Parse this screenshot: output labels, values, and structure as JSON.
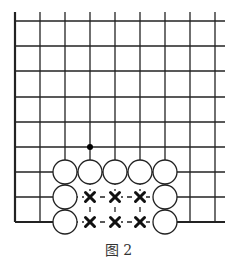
{
  "figure": {
    "caption": "图 2",
    "grid": {
      "x_lines": [
        15,
        40,
        65,
        90,
        115,
        140,
        165,
        190,
        215
      ],
      "y_lines": [
        21,
        46,
        71,
        97,
        122,
        147,
        172,
        197,
        222
      ],
      "top_extent": 12,
      "right_extent": 225,
      "line_color": "#222222"
    },
    "white_stones": [
      {
        "col": 2,
        "row": 6
      },
      {
        "col": 3,
        "row": 6
      },
      {
        "col": 4,
        "row": 6
      },
      {
        "col": 5,
        "row": 6
      },
      {
        "col": 6,
        "row": 6
      },
      {
        "col": 2,
        "row": 7
      },
      {
        "col": 6,
        "row": 7
      },
      {
        "col": 2,
        "row": 8
      },
      {
        "col": 6,
        "row": 8
      }
    ],
    "black_dot": {
      "col": 3,
      "row": 5
    },
    "x_marks": [
      {
        "col": 3,
        "row": 7
      },
      {
        "col": 4,
        "row": 7
      },
      {
        "col": 5,
        "row": 7
      },
      {
        "col": 3,
        "row": 8
      },
      {
        "col": 4,
        "row": 8
      },
      {
        "col": 5,
        "row": 8
      }
    ],
    "stone_radius": 12
  }
}
